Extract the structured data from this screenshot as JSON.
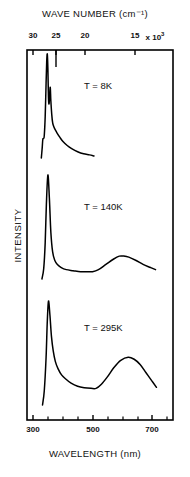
{
  "figure": {
    "top_axis_title": "WAVE NUMBER (cm⁻¹)",
    "bottom_axis_title": "WAVELENGTH (nm)",
    "y_axis_title": "INTENSITY",
    "line_color": "#000000",
    "frame_color": "#000000"
  },
  "top_ticks": [
    {
      "label": "30",
      "x": 33
    },
    {
      "label": "25",
      "x": 56
    },
    {
      "label": "20",
      "x": 85
    },
    {
      "label": "15",
      "x": 135
    }
  ],
  "top_axis_exponent": {
    "mantissa_suffix": "x 10",
    "exponent": "3",
    "x": 155
  },
  "bottom_ticks": [
    {
      "label": "300",
      "x": 33
    },
    {
      "label": "500",
      "x": 93
    },
    {
      "label": "700",
      "x": 152
    }
  ],
  "bottom_minor_ticks": [
    48,
    63,
    78,
    108,
    123,
    138,
    167
  ],
  "traces": [
    {
      "label": "T = 8K",
      "label_x": 84,
      "label_y": 80
    },
    {
      "label": "T = 140K",
      "label_x": 84,
      "label_y": 201
    },
    {
      "label": "T = 295K",
      "label_x": 84,
      "label_y": 322
    }
  ],
  "chart_data": {
    "type": "line",
    "title": "",
    "xlabel": "WAVELENGTH (nm)",
    "ylabel": "INTENSITY",
    "x2label": "WAVE NUMBER (cm^-1)",
    "xlim": [
      290,
      730
    ],
    "x2lim": [
      31000,
      14000
    ],
    "x2_scale_factor": 1000,
    "grid": false,
    "legend": "inline-annotation",
    "axis_note": "Wave number axis is reciprocal of wavelength axis; 10^7/lambda(nm) = wavenumber(cm^-1)",
    "series": [
      {
        "name": "T = 8K",
        "panel": 1,
        "peaks": [
          {
            "wavelength_nm": 348,
            "relative_intensity": 1.0,
            "type": "sharp-origin"
          },
          {
            "wavelength_nm": 358,
            "relative_intensity": 0.68,
            "type": "vibronic-shoulder"
          },
          {
            "wavelength_nm": 332,
            "relative_intensity": 0.22,
            "type": "rising-edge-shoulder"
          }
        ],
        "points": [
          [
            328,
            0.0
          ],
          [
            331,
            0.1
          ],
          [
            333,
            0.18
          ],
          [
            336,
            0.19
          ],
          [
            338,
            0.22
          ],
          [
            341,
            0.4
          ],
          [
            344,
            0.72
          ],
          [
            346,
            0.92
          ],
          [
            348,
            1.0
          ],
          [
            350,
            0.86
          ],
          [
            352,
            0.58
          ],
          [
            354,
            0.52
          ],
          [
            356,
            0.6
          ],
          [
            358,
            0.68
          ],
          [
            360,
            0.55
          ],
          [
            363,
            0.42
          ],
          [
            366,
            0.34
          ],
          [
            370,
            0.3
          ],
          [
            375,
            0.27
          ],
          [
            381,
            0.24
          ],
          [
            390,
            0.2
          ],
          [
            400,
            0.16
          ],
          [
            415,
            0.12
          ],
          [
            430,
            0.09
          ],
          [
            450,
            0.06
          ],
          [
            470,
            0.04
          ],
          [
            490,
            0.03
          ],
          [
            505,
            0.02
          ]
        ]
      },
      {
        "name": "T = 140K",
        "panel": 2,
        "peaks": [
          {
            "wavelength_nm": 350,
            "relative_intensity": 1.0,
            "type": "sharp"
          },
          {
            "wavelength_nm": 605,
            "relative_intensity": 0.22,
            "type": "broad-band"
          }
        ],
        "valleys": [
          {
            "wavelength_nm": 500,
            "relative_intensity": 0.07
          }
        ],
        "points": [
          [
            330,
            0.0
          ],
          [
            336,
            0.1
          ],
          [
            341,
            0.35
          ],
          [
            345,
            0.72
          ],
          [
            350,
            1.0
          ],
          [
            355,
            0.78
          ],
          [
            360,
            0.45
          ],
          [
            366,
            0.26
          ],
          [
            373,
            0.18
          ],
          [
            382,
            0.14
          ],
          [
            395,
            0.11
          ],
          [
            412,
            0.09
          ],
          [
            435,
            0.08
          ],
          [
            460,
            0.07
          ],
          [
            485,
            0.07
          ],
          [
            500,
            0.07
          ],
          [
            520,
            0.09
          ],
          [
            545,
            0.14
          ],
          [
            570,
            0.19
          ],
          [
            590,
            0.22
          ],
          [
            605,
            0.22
          ],
          [
            622,
            0.21
          ],
          [
            645,
            0.18
          ],
          [
            670,
            0.14
          ],
          [
            695,
            0.11
          ],
          [
            712,
            0.09
          ]
        ]
      },
      {
        "name": "T = 295K",
        "panel": 3,
        "peaks": [
          {
            "wavelength_nm": 352,
            "relative_intensity": 1.0,
            "type": "sharp"
          },
          {
            "wavelength_nm": 620,
            "relative_intensity": 0.46,
            "type": "broad-band"
          }
        ],
        "valleys": [
          {
            "wavelength_nm": 512,
            "relative_intensity": 0.16
          }
        ],
        "points": [
          [
            332,
            0.0
          ],
          [
            338,
            0.14
          ],
          [
            344,
            0.46
          ],
          [
            348,
            0.8
          ],
          [
            352,
            1.0
          ],
          [
            357,
            0.86
          ],
          [
            362,
            0.66
          ],
          [
            368,
            0.52
          ],
          [
            375,
            0.42
          ],
          [
            384,
            0.35
          ],
          [
            396,
            0.29
          ],
          [
            410,
            0.25
          ],
          [
            428,
            0.21
          ],
          [
            450,
            0.18
          ],
          [
            472,
            0.166
          ],
          [
            495,
            0.16
          ],
          [
            512,
            0.16
          ],
          [
            530,
            0.2
          ],
          [
            550,
            0.27
          ],
          [
            572,
            0.36
          ],
          [
            595,
            0.43
          ],
          [
            620,
            0.46
          ],
          [
            640,
            0.44
          ],
          [
            660,
            0.39
          ],
          [
            680,
            0.31
          ],
          [
            700,
            0.23
          ],
          [
            715,
            0.17
          ]
        ]
      }
    ]
  }
}
